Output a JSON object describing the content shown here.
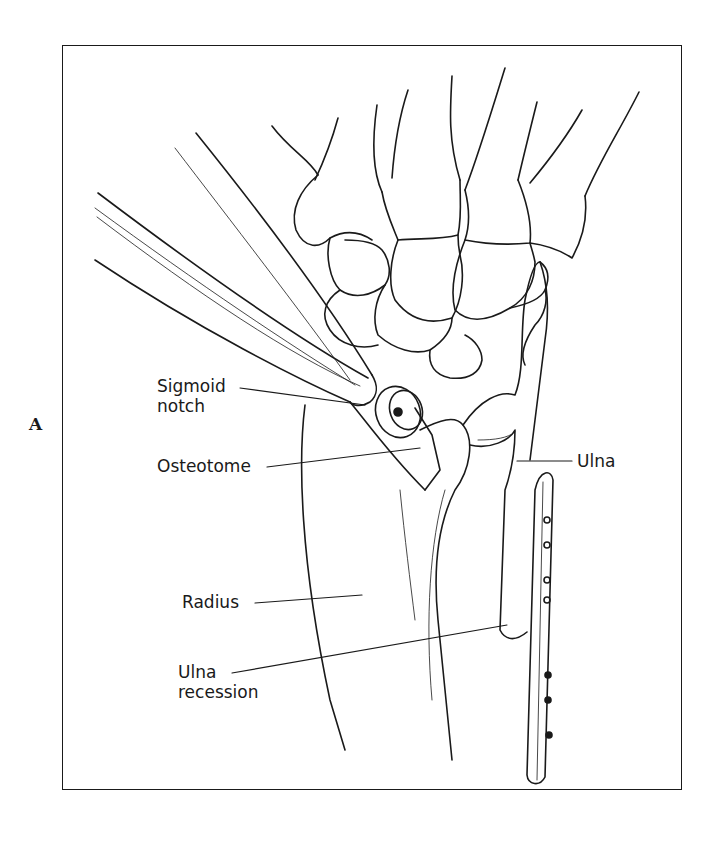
{
  "figure": {
    "panel_letter": "A",
    "labels": {
      "sigmoid_notch_line1": "Sigmoid",
      "sigmoid_notch_line2": "notch",
      "osteotome": "Osteotome",
      "ulna": "Ulna",
      "radius": "Radius",
      "ulna_recession_line1": "Ulna",
      "ulna_recession_line2": "recession"
    },
    "stroke_color": "#1a1a1a",
    "background_color": "#ffffff"
  }
}
